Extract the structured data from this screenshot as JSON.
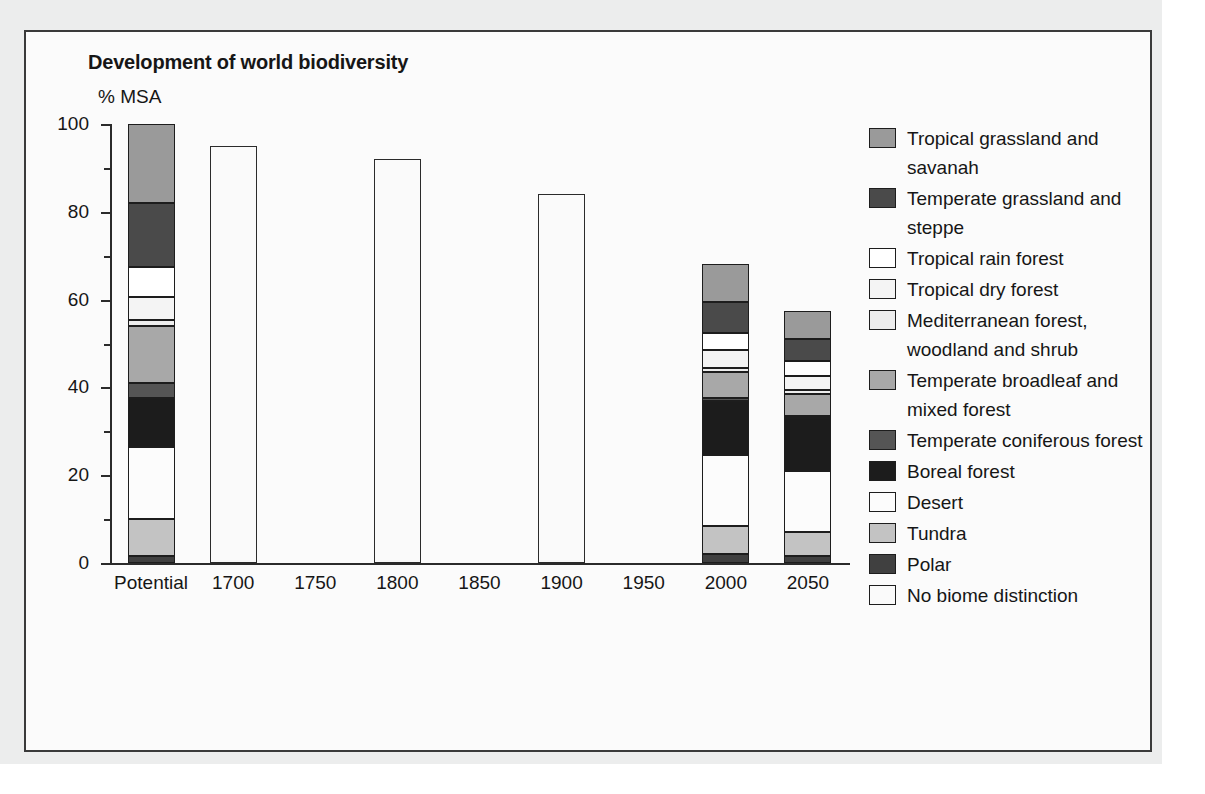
{
  "chart_title": "Development of world biodiversity",
  "y_axis_title": "% MSA",
  "legend": {
    "items": [
      {
        "label": "Tropical grassland and savanah",
        "color": "#9a9a9a"
      },
      {
        "label": "Temperate grassland and steppe",
        "color": "#4a4a4a"
      },
      {
        "label": "Tropical rain forest",
        "color": "#ffffff"
      },
      {
        "label": "Tropical dry forest",
        "color": "#f4f4f4"
      },
      {
        "label": "Mediterranean forest, woodland and shrub",
        "color": "#ededed"
      },
      {
        "label": "Temperate broadleaf and mixed forest",
        "color": "#a8a8a8"
      },
      {
        "label": "Temperate coniferous forest",
        "color": "#555555"
      },
      {
        "label": "Boreal forest",
        "color": "#1c1c1c"
      },
      {
        "label": "Desert",
        "color": "#fcfcfc"
      },
      {
        "label": "Tundra",
        "color": "#c3c3c3"
      },
      {
        "label": "Polar",
        "color": "#404040"
      },
      {
        "label": "No biome distinction",
        "color": "#fafafa"
      }
    ]
  },
  "chart_data": {
    "type": "bar",
    "subtype": "stacked-bar",
    "title": "Development of world biodiversity",
    "xlabel": "",
    "ylabel": "% MSA",
    "ylim": [
      0,
      100
    ],
    "yticks": [
      0,
      20,
      40,
      60,
      80,
      100
    ],
    "ytick_labels": [
      "0",
      "20",
      "40",
      "60",
      "80",
      "100"
    ],
    "minor_ticks": [
      10,
      30,
      50,
      70,
      90
    ],
    "grid": false,
    "legend_position": "right",
    "categories": [
      "Potential",
      "1700",
      "1750",
      "1800",
      "1850",
      "1900",
      "1950",
      "2000",
      "2050"
    ],
    "totals": [
      100,
      95,
      null,
      92,
      null,
      84,
      null,
      68,
      55
    ],
    "series": [
      {
        "name": "Tropical grassland and savanah",
        "color": "#9a9a9a",
        "values": [
          18.0,
          0,
          0,
          0,
          0,
          0,
          0,
          8.5,
          6.5
        ]
      },
      {
        "name": "Temperate grassland and steppe",
        "color": "#4a4a4a",
        "values": [
          14.5,
          0,
          0,
          0,
          0,
          0,
          0,
          7.0,
          5.0
        ]
      },
      {
        "name": "Tropical rain forest",
        "color": "#ffffff",
        "values": [
          6.8,
          0,
          0,
          0,
          0,
          0,
          0,
          4.0,
          3.5
        ]
      },
      {
        "name": "Tropical dry forest",
        "color": "#f4f4f4",
        "values": [
          5.3,
          0,
          0,
          0,
          0,
          0,
          0,
          4.0,
          3.0
        ]
      },
      {
        "name": "Mediterranean forest, woodland and shrub",
        "color": "#ededed",
        "values": [
          1.4,
          0,
          0,
          0,
          0,
          0,
          0,
          1.0,
          1.0
        ]
      },
      {
        "name": "Temperate broadleaf and mixed forest",
        "color": "#a8a8a8",
        "values": [
          13.0,
          0,
          0,
          0,
          0,
          0,
          0,
          6.0,
          5.0
        ]
      },
      {
        "name": "Temperate coniferous forest",
        "color": "#555555",
        "values": [
          3.5,
          0,
          0,
          0,
          0,
          0,
          0,
          0.5,
          0.5
        ]
      },
      {
        "name": "Boreal forest",
        "color": "#1c1c1c",
        "values": [
          11.0,
          0,
          0,
          0,
          0,
          0,
          0,
          12.5,
          12.0
        ]
      },
      {
        "name": "Desert",
        "color": "#fcfcfc",
        "values": [
          16.5,
          0,
          0,
          0,
          0,
          0,
          0,
          16.0,
          14.0
        ]
      },
      {
        "name": "Tundra",
        "color": "#c3c3c3",
        "values": [
          8.5,
          0,
          0,
          0,
          0,
          0,
          0,
          6.5,
          5.5
        ]
      },
      {
        "name": "Polar",
        "color": "#404040",
        "values": [
          1.5,
          0,
          0,
          0,
          0,
          0,
          0,
          2.0,
          1.5
        ]
      },
      {
        "name": "No biome distinction",
        "color": "#fafafa",
        "values": [
          0,
          95,
          0,
          92,
          0,
          84,
          0,
          0,
          0
        ]
      }
    ]
  }
}
